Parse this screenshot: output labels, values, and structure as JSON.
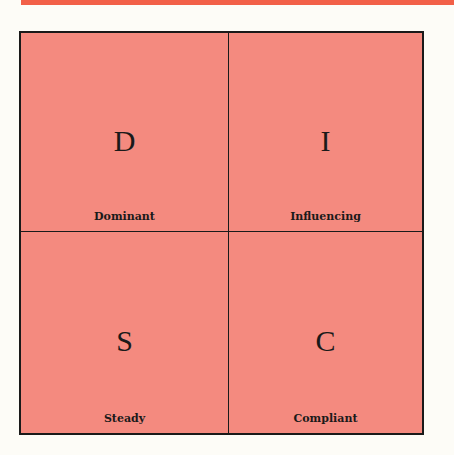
{
  "colors": {
    "top_bar": "#f26048",
    "quadrant_fill": "#f48a7f",
    "border": "#1a1a1a",
    "background": "#fdfcf7"
  },
  "quadrants": [
    {
      "letter": "D",
      "label": "Dominant"
    },
    {
      "letter": "I",
      "label": "Influencing"
    },
    {
      "letter": "S",
      "label": "Steady"
    },
    {
      "letter": "C",
      "label": "Compliant"
    }
  ]
}
